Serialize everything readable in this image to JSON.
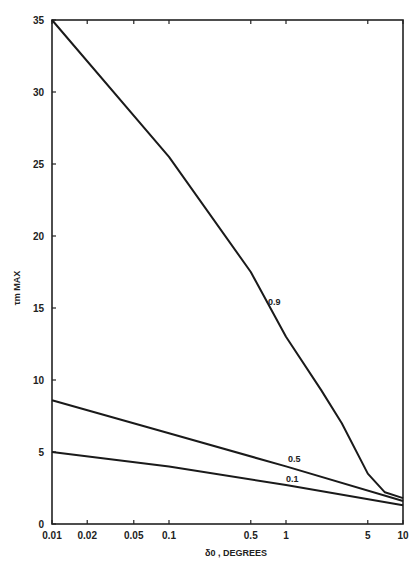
{
  "chart_data": {
    "type": "line",
    "title": "",
    "xlabel": "δ0 , DEGREES",
    "ylabel": "τm MAX",
    "x_scale": "log",
    "xlim": [
      0.01,
      10
    ],
    "ylim": [
      0,
      35
    ],
    "grid": false,
    "legend": "inline labels on curves",
    "x_ticks": [
      0.01,
      0.02,
      0.05,
      0.1,
      0.5,
      1,
      5,
      10
    ],
    "x_tick_labels": [
      "0.01",
      "0.02",
      "0.05",
      "0.1",
      "0.5",
      "1",
      "5",
      "10"
    ],
    "y_ticks": [
      0,
      5,
      10,
      15,
      20,
      25,
      30,
      35
    ],
    "y_tick_labels": [
      "0",
      "5",
      "10",
      "15",
      "20",
      "25",
      "30",
      "35"
    ],
    "series": [
      {
        "name": "0.9",
        "x": [
          0.01,
          0.1,
          0.5,
          1,
          2,
          3,
          5,
          7,
          10
        ],
        "y": [
          35,
          25.5,
          17.5,
          13.0,
          9.3,
          7.0,
          3.5,
          2.2,
          1.8
        ]
      },
      {
        "name": "0.5",
        "x": [
          0.01,
          0.1,
          1,
          10
        ],
        "y": [
          8.6,
          6.3,
          4.0,
          1.6
        ]
      },
      {
        "name": "0.1",
        "x": [
          0.01,
          0.1,
          1,
          10
        ],
        "y": [
          5.0,
          4.0,
          2.7,
          1.3
        ]
      }
    ]
  }
}
